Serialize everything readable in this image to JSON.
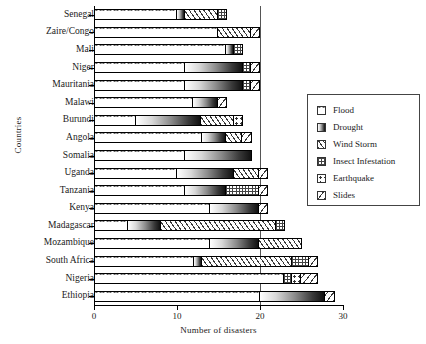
{
  "chart_data": {
    "type": "bar",
    "orientation": "horizontal",
    "stacked": true,
    "title": "",
    "xlabel": "Number of disasters",
    "ylabel": "Countries",
    "xlim": [
      0,
      30
    ],
    "xticks": [
      0,
      10,
      20,
      30
    ],
    "xtick_labels": [
      "0",
      "10",
      "20",
      "30"
    ],
    "grid": false,
    "reference_line_x": 20,
    "legend_position": "right",
    "legend": [
      "Flood",
      "Drought",
      "Wind Storm",
      "Insect Infestation",
      "Earthquake",
      "Slides"
    ],
    "categories": [
      "Senegal",
      "Zaire/Congo",
      "Mali",
      "Niger",
      "Mauritania",
      "Malawi",
      "Burundi",
      "Angola",
      "Somalia",
      "Uganda",
      "Tanzania",
      "Kenya",
      "Madagascar",
      "Mozambique",
      "South Africa",
      "Nigeria",
      "Ethiopia"
    ],
    "series": [
      {
        "name": "Flood",
        "values": [
          10,
          15,
          16,
          11,
          11,
          12,
          5,
          13,
          11,
          10,
          11,
          14,
          4,
          14,
          12,
          23,
          20
        ]
      },
      {
        "name": "Drought",
        "values": [
          1,
          0,
          1,
          7,
          7,
          3,
          8,
          3,
          8,
          7,
          5,
          6,
          4,
          6,
          1,
          0,
          8
        ]
      },
      {
        "name": "Wind Storm",
        "values": [
          4,
          4,
          0,
          0,
          0,
          0,
          4,
          2,
          0,
          3,
          0,
          0,
          14,
          5,
          11,
          0,
          0
        ]
      },
      {
        "name": "Insect Infestation",
        "values": [
          1,
          0,
          1,
          1,
          1,
          0,
          0,
          0,
          0,
          0,
          4,
          0,
          1,
          0,
          2,
          1,
          0
        ]
      },
      {
        "name": "Earthquake",
        "values": [
          0,
          0,
          0,
          0,
          0,
          0,
          1,
          0,
          0,
          0,
          0,
          0,
          0,
          0,
          0,
          1,
          0
        ]
      },
      {
        "name": "Slides",
        "values": [
          0,
          1,
          0,
          1,
          1,
          1,
          0,
          1,
          0,
          1,
          1,
          1,
          0,
          0,
          1,
          2,
          1
        ]
      }
    ],
    "totals": [
      16,
      20,
      18,
      20,
      20,
      16,
      18,
      19,
      19,
      21,
      21,
      21,
      23,
      25,
      27,
      27,
      29
    ]
  }
}
